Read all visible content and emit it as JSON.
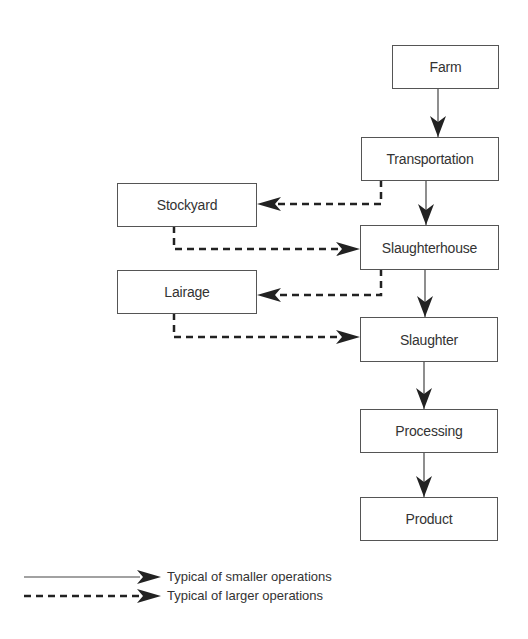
{
  "diagram": {
    "nodes": [
      {
        "id": "farm",
        "label": "Farm"
      },
      {
        "id": "transportation",
        "label": "Transportation"
      },
      {
        "id": "stockyard",
        "label": "Stockyard"
      },
      {
        "id": "slaughterhouse",
        "label": "Slaughterhouse"
      },
      {
        "id": "lairage",
        "label": "Lairage"
      },
      {
        "id": "slaughter",
        "label": "Slaughter"
      },
      {
        "id": "processing",
        "label": "Processing"
      },
      {
        "id": "product",
        "label": "Product"
      }
    ],
    "edges": [
      {
        "from": "farm",
        "to": "transportation",
        "style": "solid"
      },
      {
        "from": "transportation",
        "to": "slaughterhouse",
        "style": "solid"
      },
      {
        "from": "transportation",
        "to": "stockyard",
        "style": "dashed"
      },
      {
        "from": "stockyard",
        "to": "slaughterhouse",
        "style": "dashed"
      },
      {
        "from": "slaughterhouse",
        "to": "slaughter",
        "style": "solid"
      },
      {
        "from": "slaughterhouse",
        "to": "lairage",
        "style": "dashed"
      },
      {
        "from": "lairage",
        "to": "slaughter",
        "style": "dashed"
      },
      {
        "from": "slaughter",
        "to": "processing",
        "style": "solid"
      },
      {
        "from": "processing",
        "to": "product",
        "style": "solid"
      }
    ]
  },
  "legend": {
    "solid_label": "Typical of smaller operations",
    "dashed_label": "Typical of larger operations"
  }
}
